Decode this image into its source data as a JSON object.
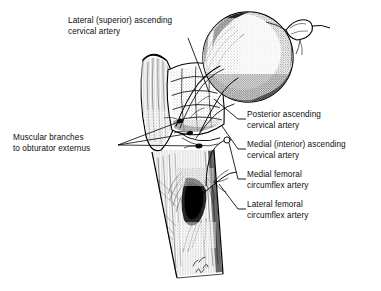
{
  "figure": {
    "ink_color": "#000000",
    "background_color": "#ffffff",
    "signature": "artist monogram",
    "structures": [
      "femoral head",
      "ligamentum teres stub",
      "femoral neck",
      "greater trochanter",
      "lesser trochanter",
      "intertrochanteric region",
      "femoral shaft",
      "retinacular vessels"
    ]
  },
  "labels": {
    "lateral_superior": {
      "line1": "Lateral (superior) ascending",
      "line2": "cervical artery"
    },
    "muscular_branches": {
      "line1": "Muscular branches",
      "line2": "to obturator externus"
    },
    "posterior_ascending": {
      "line1": "Posterior ascending",
      "line2": "cervical artery"
    },
    "medial_interior_ascending": {
      "line1": "Medial (interior) ascending",
      "line2": "cervical artery"
    },
    "medial_femoral_circumflex": {
      "line1": "Medial femoral",
      "line2": "circumflex artery"
    },
    "lateral_femoral_circumflex": {
      "line1": "Lateral femoral",
      "line2": "circumflex artery"
    }
  }
}
